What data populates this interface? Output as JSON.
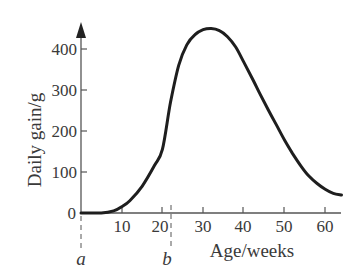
{
  "chart_data": {
    "type": "line",
    "title": "",
    "xlabel": "Age/weeks",
    "ylabel": "Daily gain/g",
    "xlim": [
      0,
      64
    ],
    "ylim": [
      0,
      460
    ],
    "x_ticks": [
      10,
      20,
      30,
      40,
      50,
      60
    ],
    "y_ticks": [
      0,
      100,
      200,
      300,
      400
    ],
    "grid": false,
    "legend": null,
    "annotations": [
      {
        "label": "a",
        "x": 0,
        "style": "dashed vertical marker below axis"
      },
      {
        "label": "b",
        "x": 22,
        "style": "dashed vertical marker below axis"
      }
    ],
    "series": [
      {
        "name": "Daily gain",
        "x": [
          0,
          5,
          8,
          10,
          12,
          15,
          18,
          20,
          22,
          24,
          26,
          28,
          30,
          32,
          34,
          36,
          38,
          40,
          42,
          44,
          46,
          48,
          50,
          52,
          54,
          56,
          58,
          60,
          62,
          64
        ],
        "values": [
          0,
          0,
          5,
          15,
          30,
          65,
          115,
          155,
          270,
          360,
          410,
          435,
          447,
          450,
          445,
          430,
          405,
          368,
          330,
          290,
          252,
          215,
          178,
          145,
          115,
          90,
          72,
          58,
          48,
          44
        ]
      }
    ]
  },
  "labels": {
    "y_axis_title": "Daily gain/g",
    "x_axis_title": "Age/weeks",
    "y_tick_0": "0",
    "y_tick_100": "100",
    "y_tick_200": "200",
    "y_tick_300": "300",
    "y_tick_400": "400",
    "x_tick_10": "10",
    "x_tick_20": "20",
    "x_tick_30": "30",
    "x_tick_40": "40",
    "x_tick_50": "50",
    "x_tick_60": "60",
    "marker_a": "a",
    "marker_b": "b"
  }
}
